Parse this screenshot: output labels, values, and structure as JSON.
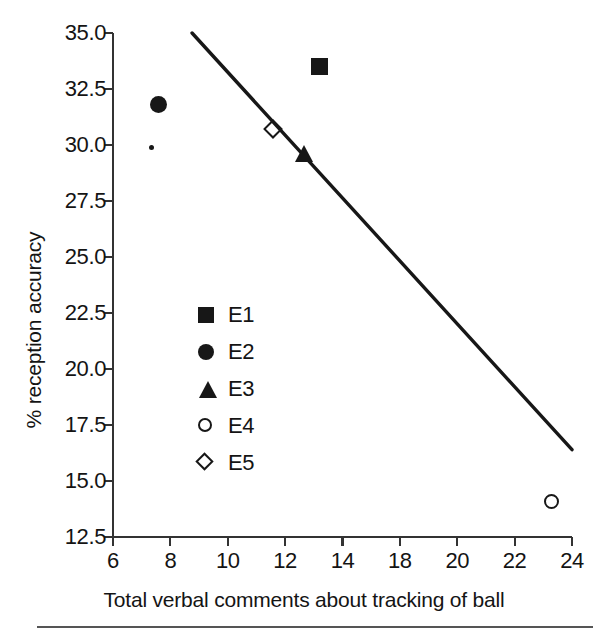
{
  "chart_data": {
    "type": "scatter",
    "title": "",
    "xlabel": "Total verbal comments about tracking of ball",
    "ylabel": "% reception accuracy",
    "xlim": [
      6,
      24
    ],
    "ylim": [
      12.5,
      35.0
    ],
    "grid": false,
    "legend_position": "center-left inside plot",
    "xticks": [
      6,
      8,
      10,
      12,
      14,
      18,
      20,
      22,
      24
    ],
    "xtick_labels": [
      "6",
      "8",
      "10",
      "12",
      "14",
      "18",
      "20",
      "22",
      "24"
    ],
    "yticks": [
      12.5,
      15.0,
      17.5,
      20.0,
      22.5,
      25.0,
      27.5,
      30.0,
      32.5,
      35.0
    ],
    "ytick_labels": [
      "12.5",
      "15.0",
      "17.5",
      "20.0",
      "22.5",
      "25.0",
      "27.5",
      "30.0",
      "32.5",
      "35.0"
    ],
    "series": [
      {
        "name": "E1",
        "marker": "filled-square",
        "x": 14.1,
        "y": 33.5
      },
      {
        "name": "E2",
        "marker": "filled-circle",
        "x": 7.8,
        "y": 31.8
      },
      {
        "name": "E3",
        "marker": "filled-triangle",
        "x": 13.5,
        "y": 29.6
      },
      {
        "name": "E4",
        "marker": "open-circle",
        "x": 23.2,
        "y": 14.1
      },
      {
        "name": "E5",
        "marker": "open-diamond",
        "x": 12.4,
        "y": 30.6
      }
    ],
    "extra_points": [
      {
        "name": "speck",
        "marker": "dot",
        "x": 7.5,
        "y": 29.9
      }
    ],
    "trend_line": {
      "type": "linear-regression",
      "x_start": 9.1,
      "y_start": 35.0,
      "x_end": 24.0,
      "y_end": 16.4
    },
    "colors": {
      "marker": "#171717",
      "axis": "#333333",
      "text": "#141414",
      "trend_line": "#171717",
      "background": "#ffffff",
      "rule": "#555555"
    }
  },
  "legend": {
    "items": [
      {
        "label": "E1",
        "marker": "filled-square"
      },
      {
        "label": "E2",
        "marker": "filled-circle"
      },
      {
        "label": "E3",
        "marker": "filled-triangle"
      },
      {
        "label": "E4",
        "marker": "open-circle"
      },
      {
        "label": "E5",
        "marker": "open-diamond"
      }
    ]
  }
}
